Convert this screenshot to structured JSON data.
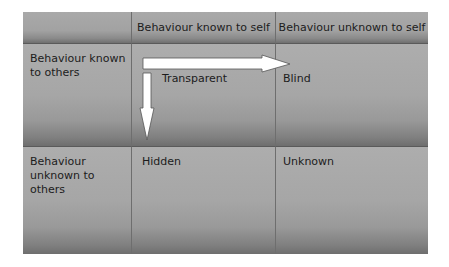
{
  "diagram": {
    "column_headers": [
      "",
      "Behaviour known to self",
      "Behaviour unknown to self"
    ],
    "row_headers": [
      "Behaviour known to others",
      "Behaviour unknown to others"
    ],
    "quadrants": {
      "transparent": "Transparent",
      "blind": "Blind",
      "hidden": "Hidden",
      "unknown": "Unknown"
    },
    "arrows": [
      {
        "name": "horizontal-arrow",
        "from": "Transparent",
        "direction": "right",
        "into": "Blind"
      },
      {
        "name": "vertical-arrow",
        "from": "Transparent",
        "direction": "down",
        "into": "Hidden"
      }
    ],
    "colors": {
      "cell_fill": "#a8a8a8",
      "cell_shadow": "#6e6e6e",
      "grid_line": "#6e6e6e",
      "arrow_fill": "#ffffff",
      "text": "#1c1c1c"
    }
  }
}
